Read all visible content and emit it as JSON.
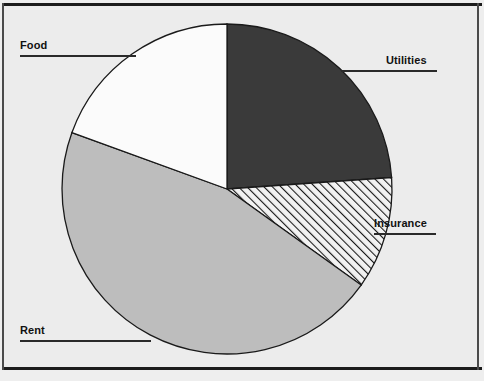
{
  "chart_data": {
    "type": "pie",
    "title": "",
    "subtitle": "",
    "xlabel": "",
    "ylabel": "",
    "legend_position": "none",
    "grid": false,
    "labels_placement": "outside-with-leader-lines",
    "start_angle_deg": 0,
    "direction": "clockwise",
    "categories": [
      "Utilities",
      "Insurance",
      "Rent",
      "Food"
    ],
    "values": [
      23.9,
      11.0,
      45.7,
      19.4
    ],
    "units": "percent",
    "slices": [
      {
        "label": "Utilities",
        "value": 23.9,
        "start_angle_deg": 0,
        "end_angle_deg": 86,
        "fill": "#3a3a3a",
        "fill_style": "solid",
        "edge": "#1a1a1a"
      },
      {
        "label": "Insurance",
        "value": 11.0,
        "start_angle_deg": 86,
        "end_angle_deg": 125.6,
        "fill": "#f2f2f2",
        "fill_style": "diagonal-hatch",
        "edge": "#1a1a1a"
      },
      {
        "label": "Rent",
        "value": 45.7,
        "start_angle_deg": 125.6,
        "end_angle_deg": 290,
        "fill": "#bdbdbd",
        "fill_style": "solid",
        "edge": "#1a1a1a"
      },
      {
        "label": "Food",
        "value": 19.4,
        "start_angle_deg": 290,
        "end_angle_deg": 360,
        "fill": "#fbfbfb",
        "fill_style": "solid",
        "edge": "#1a1a1a"
      }
    ],
    "geometry": {
      "center_x": 227,
      "center_y": 189,
      "radius": 165
    }
  },
  "labels": {
    "food": "Food",
    "utilities": "Utilities",
    "insurance": "Insurance",
    "rent": "Rent"
  },
  "colors": {
    "background": "#eeeeee",
    "plot_background": "#ececec",
    "border": "#1c1c1c",
    "slice_dark": "#3a3a3a",
    "slice_gray": "#bdbdbd",
    "slice_white": "#fbfbfb",
    "hatch_background": "#f2f2f2",
    "hatch_line": "#1a1a1a",
    "label_text": "#111111",
    "leader_line": "#2a2a2a"
  }
}
